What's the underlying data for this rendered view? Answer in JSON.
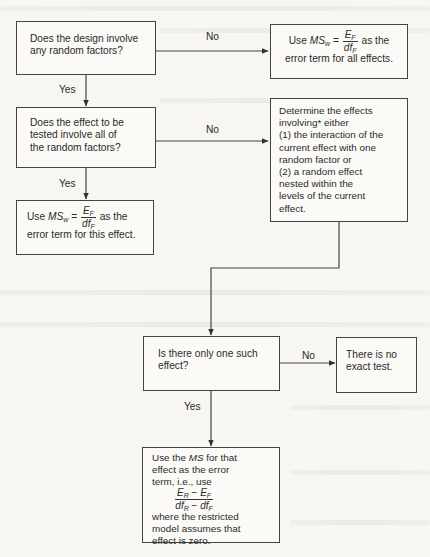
{
  "flowchart": {
    "nodes": {
      "q1": {
        "lines": [
          "Does the design involve",
          "any random factors?"
        ]
      },
      "all_effects": {
        "prefix": "Use ",
        "ms": "MS",
        "ms_sub": "w",
        "equals": " = ",
        "num": "E",
        "num_sub": "F",
        "den": "df",
        "den_sub": "F",
        "suffix": " as the",
        "line2": "error term for all effects."
      },
      "q2": {
        "lines": [
          "Does the effect to be",
          "tested involve all of",
          "the random factors?"
        ]
      },
      "determine": {
        "lines": [
          "Determine the effects",
          "involving* either",
          "(1) the interaction of the",
          "current effect with one",
          "random factor or",
          "(2) a random effect",
          "nested within the",
          "levels of the current",
          "effect."
        ]
      },
      "this_effect": {
        "prefix": "Use ",
        "ms": "MS",
        "ms_sub": "w",
        "equals": " = ",
        "num": "E",
        "num_sub": "F",
        "den": "df",
        "den_sub": "F",
        "suffix": " as the",
        "line2": "error term for this effect."
      },
      "q3": {
        "lines": [
          "Is there only one such",
          "effect?"
        ]
      },
      "no_test": {
        "lines": [
          "There is no",
          "exact test."
        ]
      },
      "use_ms": {
        "line1_pre": "Use the ",
        "line1_ms": "MS",
        "line1_post": " for that",
        "line2": "effect as the error",
        "line3": "term, i.e., use",
        "num_a": "E",
        "num_a_sub": "R",
        "num_op": " − ",
        "num_b": "E",
        "num_b_sub": "F",
        "den_a": "df",
        "den_a_sub": "R",
        "den_op": " − ",
        "den_b": "df",
        "den_b_sub": "F",
        "tail": [
          "where the restricted",
          "model assumes that",
          "effect is zero."
        ]
      }
    },
    "edge_labels": {
      "q1_no": "No",
      "q1_yes": "Yes",
      "q2_no": "No",
      "q2_yes": "Yes",
      "q3_no": "No",
      "q3_yes": "Yes"
    }
  }
}
